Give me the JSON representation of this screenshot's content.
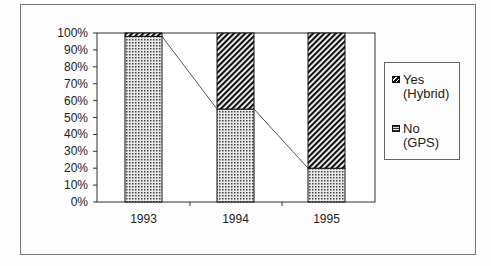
{
  "chart_data": {
    "type": "bar",
    "stacked": "percent",
    "title": "",
    "xlabel": "",
    "ylabel": "",
    "categories": [
      "1993",
      "1994",
      "1995"
    ],
    "series": [
      {
        "name": "No (GPS)",
        "values": [
          98,
          55,
          20
        ],
        "pattern": "dotted"
      },
      {
        "name": "Yes (Hybrid)",
        "values": [
          2,
          45,
          80
        ],
        "pattern": "diagonal-hatch"
      }
    ],
    "ylim": [
      0,
      100
    ],
    "yticks": [
      "0%",
      "10%",
      "20%",
      "30%",
      "40%",
      "50%",
      "60%",
      "70%",
      "80%",
      "90%",
      "100%"
    ],
    "series_lines": true,
    "grid": false,
    "legend_position": "right"
  },
  "legend": {
    "yes_line1": "Yes",
    "yes_line2": "(Hybrid)",
    "no_line1": "No",
    "no_line2": "(GPS)"
  },
  "axis": {
    "y": [
      "100%",
      "90%",
      "80%",
      "70%",
      "60%",
      "50%",
      "40%",
      "30%",
      "20%",
      "10%",
      "0%"
    ],
    "x": [
      "1993",
      "1994",
      "1995"
    ]
  }
}
